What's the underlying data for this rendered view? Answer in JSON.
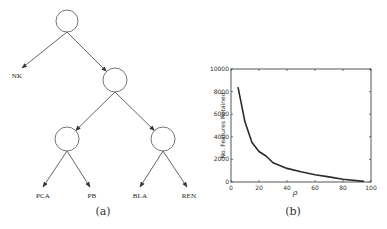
{
  "figure_a": {
    "caption": "(a)",
    "nodes": [
      {
        "id": "root",
        "cx": 67,
        "cy": 21,
        "r": 11
      },
      {
        "id": "n1",
        "cx": 115,
        "cy": 80,
        "r": 12
      },
      {
        "id": "n2",
        "cx": 67,
        "cy": 139,
        "r": 12
      },
      {
        "id": "n3",
        "cx": 163,
        "cy": 139,
        "r": 12
      }
    ],
    "leaves": [
      {
        "label": "NK",
        "x": 17,
        "y": 76
      },
      {
        "label": "PCA",
        "x": 43,
        "y": 196
      },
      {
        "label": "PB",
        "x": 92,
        "y": 196
      },
      {
        "label": "BLA",
        "x": 140,
        "y": 196
      },
      {
        "label": "REN",
        "x": 189,
        "y": 196
      }
    ]
  },
  "figure_b": {
    "caption": "(b)"
  },
  "chart_data": {
    "type": "line",
    "title": "",
    "xlabel": "ρ",
    "ylabel": "No. Features Retained",
    "xlim": [
      0,
      100
    ],
    "ylim": [
      0,
      10000
    ],
    "xticks": [
      0,
      20,
      40,
      60,
      80,
      100
    ],
    "yticks": [
      0,
      2000,
      4000,
      6000,
      8000,
      10000
    ],
    "grid": false,
    "legend": null,
    "series": [
      {
        "name": "features",
        "x": [
          5,
          10,
          15,
          20,
          25,
          30,
          40,
          50,
          60,
          70,
          80,
          95
        ],
        "y": [
          8400,
          5300,
          3500,
          2700,
          2300,
          1700,
          1200,
          900,
          650,
          450,
          250,
          50
        ]
      }
    ]
  }
}
